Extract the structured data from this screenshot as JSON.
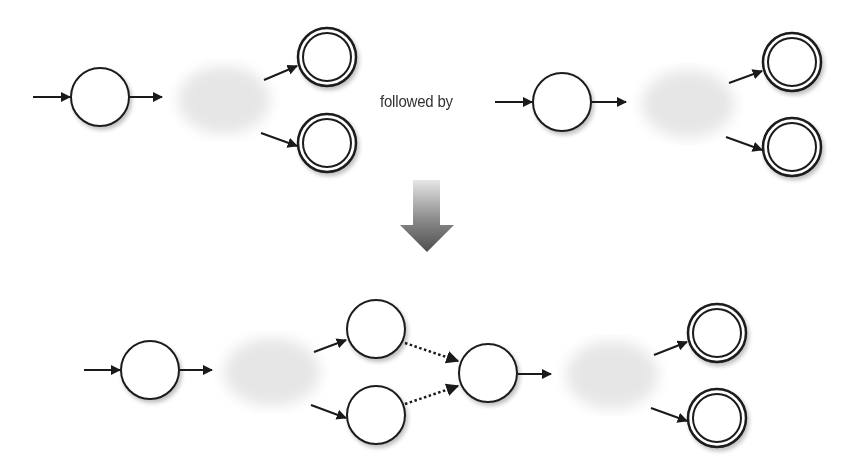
{
  "diagram": {
    "connector_label": "followed by",
    "colors": {
      "stroke": "#1a1a1a",
      "node_fill": "#ffffff",
      "cloud": "#e8e8e8",
      "text": "#333333",
      "big_arrow_top": "#dcdcdc",
      "big_arrow_bottom": "#555555"
    },
    "top_left_machine": {
      "start_state": {
        "cx": 100,
        "cy": 97,
        "r": 29
      },
      "accept_states": [
        {
          "cx": 327,
          "cy": 57,
          "r": 29
        },
        {
          "cx": 327,
          "cy": 143,
          "r": 29
        }
      ],
      "cloud": {
        "cx": 224,
        "cy": 100,
        "rx": 48,
        "ry": 36
      }
    },
    "top_right_machine": {
      "start_state": {
        "cx": 562,
        "cy": 102,
        "r": 29
      },
      "accept_states": [
        {
          "cx": 792,
          "cy": 62,
          "r": 29
        },
        {
          "cx": 792,
          "cy": 147,
          "r": 29
        }
      ],
      "cloud": {
        "cx": 688,
        "cy": 104,
        "rx": 48,
        "ry": 36
      }
    },
    "result_machine": {
      "start_state": {
        "cx": 150,
        "cy": 370,
        "r": 29
      },
      "former_accept_states": [
        {
          "cx": 376,
          "cy": 329,
          "r": 29
        },
        {
          "cx": 376,
          "cy": 415,
          "r": 29
        }
      ],
      "join_state": {
        "cx": 488,
        "cy": 373,
        "r": 29
      },
      "accept_states": [
        {
          "cx": 717,
          "cy": 333,
          "r": 29
        },
        {
          "cx": 717,
          "cy": 418,
          "r": 29
        }
      ],
      "clouds": [
        {
          "cx": 272,
          "cy": 372,
          "rx": 50,
          "ry": 36
        },
        {
          "cx": 612,
          "cy": 375,
          "rx": 48,
          "ry": 36
        }
      ],
      "epsilon_transition_style": "dotted"
    },
    "transform_arrow": {
      "direction": "down"
    }
  }
}
